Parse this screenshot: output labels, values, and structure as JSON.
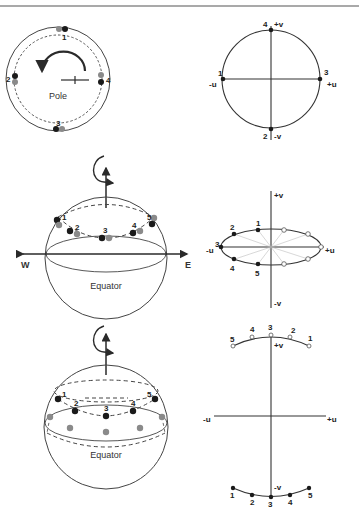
{
  "colors": {
    "ink": "#2a2a2a",
    "dot_black": "#1a1a1a",
    "dot_gray": "#8a8a8a",
    "thin_gray": "#bdbdbd",
    "background": "#ffffff"
  },
  "panel_pole_view": {
    "label": "Pole",
    "points": [
      "1",
      "2",
      "3",
      "4"
    ]
  },
  "panel_pole_uv": {
    "axis_labels": {
      "pos_v": "+v",
      "neg_v": "-v",
      "pos_u": "+u",
      "neg_u": "-u"
    },
    "points": {
      "top": "4",
      "left": "1",
      "right": "3",
      "bottom": "2"
    }
  },
  "panel_mid_sphere": {
    "west": "W",
    "east": "E",
    "equator": "Equator",
    "points": [
      "1",
      "2",
      "3",
      "4",
      "5"
    ]
  },
  "panel_mid_uv": {
    "axis_labels": {
      "pos_v": "+v",
      "neg_v": "-v",
      "pos_u": "+u",
      "neg_u": "-u"
    },
    "points": [
      "1",
      "2",
      "3",
      "4",
      "5"
    ]
  },
  "panel_low_sphere": {
    "equator": "Equator",
    "points": [
      "1",
      "2",
      "3",
      "4",
      "5"
    ]
  },
  "panel_low_uv": {
    "axis_labels": {
      "pos_v": "+v",
      "neg_v": "-v",
      "pos_u": "+u",
      "neg_u": "-u"
    },
    "top_points": [
      "5",
      "4",
      "3",
      "2",
      "1"
    ],
    "bottom_points": [
      "1",
      "2",
      "3",
      "4",
      "5"
    ]
  }
}
